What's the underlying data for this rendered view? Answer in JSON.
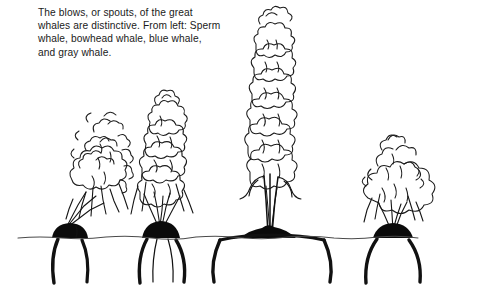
{
  "figure": {
    "width": 485,
    "height": 296,
    "background_color": "#ffffff",
    "ink_color": "#111111",
    "water_line_color": "#4a4a4a"
  },
  "caption": {
    "text": "The blows, or spouts, of the great\nwhales are distinctive. From left: Sperm\nwhale, bowhead whale, blue whale,\nand gray whale.",
    "lines": [
      "The blows, or spouts, of the great",
      "whales are distinctive. From left: Sperm",
      "whale, bowhead whale, blue whale,",
      "and gray whale."
    ]
  },
  "scene": {
    "water_line_label": "sea-surface",
    "water_line_y": 238,
    "water_line_start_x": 18,
    "water_line_end_x": 466
  },
  "whales": [
    {
      "id": "sperm-whale",
      "name": "Sperm whale",
      "order": 1,
      "blow_shape": "angled forward-left single bushy spout",
      "body_center_x": 72,
      "blow_top_y": 104
    },
    {
      "id": "bowhead-whale",
      "name": "Bowhead whale",
      "order": 2,
      "blow_shape": "tall V-shaped double spout",
      "body_center_x": 160,
      "blow_top_y": 96
    },
    {
      "id": "blue-whale",
      "name": "Blue whale",
      "order": 3,
      "blow_shape": "tall narrow vertical column",
      "body_center_x": 270,
      "blow_top_y": 12
    },
    {
      "id": "gray-whale",
      "name": "Gray whale",
      "order": 4,
      "blow_shape": "low bushy heart-shaped spout",
      "body_center_x": 393,
      "blow_top_y": 124
    }
  ]
}
